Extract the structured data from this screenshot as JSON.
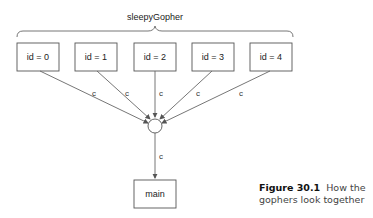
{
  "diagram": {
    "group_label": "sleepyGopher",
    "nodes": [
      {
        "id": "g0",
        "label": "id = 0"
      },
      {
        "id": "g1",
        "label": "id = 1"
      },
      {
        "id": "g2",
        "label": "id = 2"
      },
      {
        "id": "g3",
        "label": "id = 3"
      },
      {
        "id": "g4",
        "label": "id = 4"
      },
      {
        "id": "main",
        "label": "main"
      }
    ],
    "channel_node": {
      "id": "c",
      "shape": "circle"
    },
    "edges": [
      {
        "from": "g0",
        "to": "c",
        "label": "c"
      },
      {
        "from": "g1",
        "to": "c",
        "label": "c"
      },
      {
        "from": "g2",
        "to": "c",
        "label": "c"
      },
      {
        "from": "g3",
        "to": "c",
        "label": "c"
      },
      {
        "from": "g4",
        "to": "c",
        "label": "c"
      },
      {
        "from": "c",
        "to": "main",
        "label": "c"
      }
    ]
  },
  "caption": {
    "figure_number": "Figure 30.1",
    "text": "How the gophers look together"
  }
}
